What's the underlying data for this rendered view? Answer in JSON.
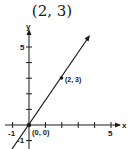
{
  "title": "(2, 3)",
  "axes": {
    "x_label": "x",
    "y_label": "y",
    "x_ticks": [
      {
        "value": -1,
        "label": "-1"
      },
      {
        "value": 5,
        "label": "5"
      }
    ],
    "y_ticks": [
      {
        "value": 5,
        "label": "5"
      },
      {
        "value": -1,
        "label": "-1"
      }
    ],
    "x_range": [
      -1,
      5
    ],
    "y_range": [
      -1,
      5
    ]
  },
  "points": [
    {
      "x": 0,
      "y": 0,
      "label": "(0, 0)"
    },
    {
      "x": 2,
      "y": 3,
      "label": "(2, 3)"
    }
  ],
  "vector": {
    "from": [
      0,
      0
    ],
    "through": [
      2,
      3
    ],
    "arrow": true
  },
  "colors": {
    "ink": "#1a1a1a",
    "background": "#ffffff"
  }
}
